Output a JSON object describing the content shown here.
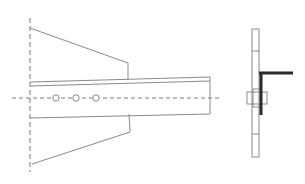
{
  "diagram": {
    "type": "technical-drawing",
    "colors": {
      "background": "#ffffff",
      "line": "#8a8a8a",
      "dash": "#7a7a7a",
      "bold": "#2a2a2a"
    },
    "front_view": {
      "wall_dash_line": {
        "x": 30,
        "y1": 18,
        "y2": 172
      },
      "top_gusset": [
        [
          30,
          28
        ],
        [
          128,
          63
        ],
        [
          128,
          80
        ]
      ],
      "bottom_gusset": [
        [
          129,
          114
        ],
        [
          130,
          132
        ],
        [
          32,
          164
        ]
      ],
      "beam": {
        "top_edge": [
          [
            30,
            82
          ],
          [
            210,
            77
          ]
        ],
        "flange_line": [
          [
            30,
            86
          ],
          [
            210,
            81
          ]
        ],
        "bottom_edge": [
          [
            30,
            118
          ],
          [
            210,
            114
          ]
        ],
        "end_x": 210
      },
      "centerline": {
        "x1": 12,
        "x2": 222,
        "y": 98
      },
      "bolt_holes": [
        {
          "cx": 56,
          "cy": 98,
          "r": 3.2
        },
        {
          "cx": 76,
          "cy": 98,
          "r": 3.2
        },
        {
          "cx": 96,
          "cy": 98,
          "r": 3.2
        }
      ]
    },
    "side_view": {
      "plate": {
        "x1": 252,
        "y_top": 29,
        "x2": 259,
        "y_bottom": 157,
        "ticks_y": [
          51,
          134
        ]
      },
      "angle": {
        "horizontal_arm": [
          [
            259,
            73
          ],
          [
            293,
            73
          ]
        ],
        "vertical_leg": [
          [
            261,
            73
          ],
          [
            261,
            115
          ]
        ]
      },
      "bolt": {
        "x": 247,
        "y": 92,
        "w": 20,
        "h": 12
      }
    }
  }
}
